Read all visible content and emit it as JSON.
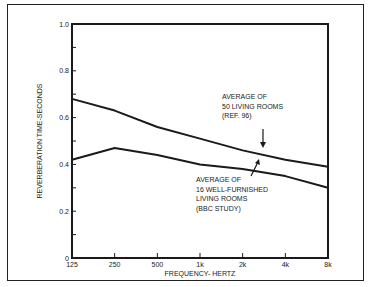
{
  "chart_data": {
    "type": "line",
    "title": "",
    "xlabel": "FREQUENCY- HERTZ",
    "ylabel": "REVERBERATION TIME-SECONDS",
    "categories": [
      "125",
      "250",
      "500",
      "1k",
      "2k",
      "4k",
      "8k"
    ],
    "x_scale": "log",
    "ylim": [
      0,
      1.0
    ],
    "yticks": [
      "0",
      "0.2",
      "0.4",
      "0.6",
      "0.8",
      "1.0"
    ],
    "grid": false,
    "series": [
      {
        "name": "Average of 50 living rooms (Ref. 96)",
        "values": [
          0.68,
          0.63,
          0.56,
          0.51,
          0.46,
          0.42,
          0.39
        ]
      },
      {
        "name": "Average of 16 well-furnished living rooms (BBC Study)",
        "values": [
          0.42,
          0.47,
          0.44,
          0.4,
          0.38,
          0.35,
          0.3
        ]
      }
    ],
    "annotations": [
      {
        "lines": [
          "AVERAGE OF",
          "50 LIVING ROOMS",
          "(REF. 96)"
        ],
        "points_to": "series 0 near 2k-4k"
      },
      {
        "lines": [
          "AVERAGE OF",
          "16 WELL-FURNISHED",
          "LIVING ROOMS",
          "(BBC STUDY)"
        ],
        "points_to": "series 1 near 2k"
      }
    ]
  },
  "labels": {
    "xlabel": "FREQUENCY- HERTZ",
    "ylabel": "REVERBERATION TIME-SECONDS",
    "ann1": [
      "AVERAGE OF",
      "50 LIVING ROOMS",
      "(REF. 96)"
    ],
    "ann2": [
      "AVERAGE OF",
      "16 WELL-FURNISHED",
      "LIVING ROOMS",
      "(BBC STUDY)"
    ]
  }
}
